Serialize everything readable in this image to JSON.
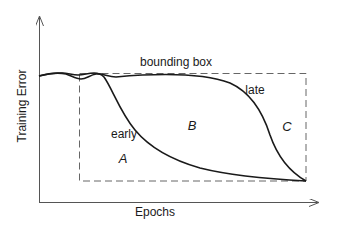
{
  "diagram": {
    "axes": {
      "x_label": "Epochs",
      "y_label": "Training Error"
    },
    "bounding_box_label": "bounding box",
    "curves": [
      {
        "name": "early",
        "label": "early"
      },
      {
        "name": "late",
        "label": "late"
      }
    ],
    "regions": [
      {
        "id": "A",
        "label": "A"
      },
      {
        "id": "B",
        "label": "B"
      },
      {
        "id": "C",
        "label": "C"
      }
    ],
    "colors": {
      "curve": "#1a1a1a",
      "axis": "#555555",
      "box": "#666666"
    }
  }
}
